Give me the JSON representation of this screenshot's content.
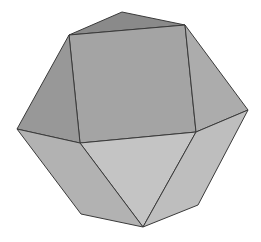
{
  "figure": {
    "background": "#ffffff",
    "edge_color": "#3a3a3a",
    "vertices": {
      "T": [
        122,
        12
      ],
      "A": [
        69,
        35
      ],
      "B": [
        185,
        25
      ],
      "C": [
        196,
        132
      ],
      "D": [
        80,
        143
      ],
      "L": [
        17,
        129
      ],
      "R": [
        248,
        110
      ],
      "BL": [
        81,
        214
      ],
      "BR": [
        198,
        205
      ],
      "BOT": [
        143,
        227
      ]
    },
    "faces": [
      {
        "name": "top-triangle",
        "vertices": [
          "T",
          "B",
          "A"
        ],
        "fill": "#8a8a8a"
      },
      {
        "name": "square-face",
        "vertices": [
          "A",
          "B",
          "C",
          "D"
        ],
        "fill": "#a4a4a4"
      },
      {
        "name": "left-upper-triangle",
        "vertices": [
          "A",
          "D",
          "L"
        ],
        "fill": "#989898"
      },
      {
        "name": "right-upper-triangle",
        "vertices": [
          "B",
          "R",
          "C"
        ],
        "fill": "#acacac"
      },
      {
        "name": "front-lower-triangle",
        "vertices": [
          "D",
          "C",
          "BOT"
        ],
        "fill": "#c4c4c4"
      },
      {
        "name": "lower-left-face",
        "vertices": [
          "L",
          "D",
          "BOT",
          "BL"
        ],
        "fill": "#b2b2b2"
      },
      {
        "name": "lower-right-face",
        "vertices": [
          "C",
          "R",
          "BR",
          "BOT"
        ],
        "fill": "#bebebe"
      }
    ]
  }
}
